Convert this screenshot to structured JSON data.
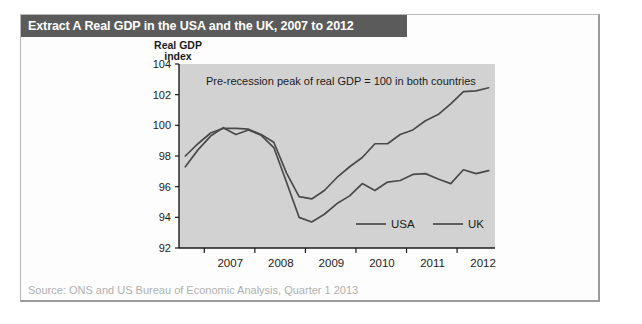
{
  "figure": {
    "title": "Extract A Real GDP in the USA and the UK, 2007 to 2012",
    "source": "Source: ONS and US Bureau of Economic Analysis, Quarter 1 2013"
  },
  "colors": {
    "title_bar_bg": "#5b5b5b",
    "title_bar_text": "#ffffff",
    "plot_bg": "#d2d2d2",
    "line": "#4a4a4a",
    "source_text": "#b0b0b0",
    "frame_border": "#b8b8b8"
  },
  "chart_data": {
    "type": "line",
    "title": "Real GDP index",
    "ylabel_line1": "Real GDP",
    "ylabel_line2": "index",
    "xlabel": "",
    "annotation": "Pre-recession peak of real GDP = 100 in both countries",
    "grid": false,
    "legend_position": "inside-bottom-right",
    "ylim": [
      92,
      104
    ],
    "yticks": [
      92,
      94,
      96,
      98,
      100,
      102,
      104
    ],
    "ytick_labels": [
      "92",
      "94",
      "96",
      "98",
      "100",
      "102",
      "104"
    ],
    "xlim": [
      2006.5,
      2012.75
    ],
    "xticks": [
      2007,
      2008,
      2009,
      2010,
      2011,
      2012
    ],
    "xtick_labels": [
      "2007",
      "2008",
      "2009",
      "2010",
      "2011",
      "2012"
    ],
    "x": [
      2006.625,
      2006.875,
      2007.125,
      2007.375,
      2007.625,
      2007.875,
      2008.125,
      2008.375,
      2008.625,
      2008.875,
      2009.125,
      2009.375,
      2009.625,
      2009.875,
      2010.125,
      2010.375,
      2010.625,
      2010.875,
      2011.125,
      2011.375,
      2011.625,
      2011.875,
      2012.125,
      2012.375,
      2012.625
    ],
    "series": [
      {
        "name": "USA",
        "values": [
          98.0,
          98.8,
          99.5,
          99.8,
          99.8,
          99.75,
          99.4,
          98.9,
          96.9,
          95.35,
          95.2,
          95.75,
          96.6,
          97.3,
          97.9,
          98.8,
          98.8,
          99.4,
          99.7,
          100.3,
          100.7,
          101.4,
          102.2,
          102.25,
          102.45
        ]
      },
      {
        "name": "UK",
        "values": [
          97.3,
          98.4,
          99.3,
          99.85,
          99.4,
          99.7,
          99.35,
          98.55,
          96.3,
          94.0,
          93.7,
          94.2,
          94.9,
          95.4,
          96.2,
          95.75,
          96.3,
          96.4,
          96.8,
          96.85,
          96.5,
          96.2,
          97.1,
          96.85,
          97.05
        ]
      }
    ],
    "legend": [
      {
        "label": "USA"
      },
      {
        "label": "UK"
      }
    ]
  }
}
